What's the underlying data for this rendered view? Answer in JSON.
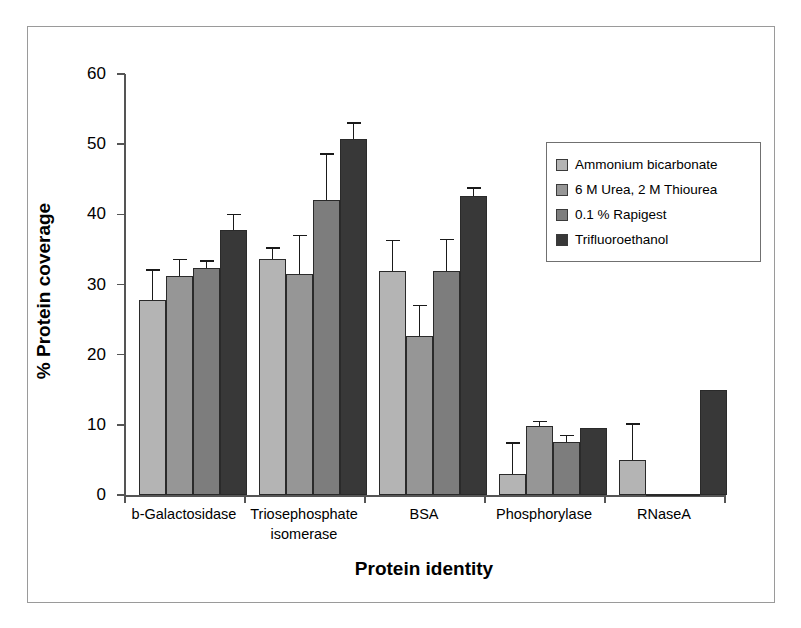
{
  "chart_data": {
    "type": "bar",
    "title": "",
    "xlabel": "Protein identity",
    "ylabel": "% Protein coverage",
    "ylim": [
      0,
      60
    ],
    "yticks": [
      0,
      10,
      20,
      30,
      40,
      50,
      60
    ],
    "ytick_labels": [
      "0",
      "10",
      "20",
      "30",
      "40",
      "50",
      "60"
    ],
    "grid": false,
    "legend_position": "upper right",
    "orientation": "vertical",
    "error_bars": "upper-only",
    "categories": [
      "b-Galactosidase",
      "Triosephosphate isomerase",
      "BSA",
      "Phosphorylase",
      "RNaseA"
    ],
    "category_lines": [
      [
        "b-Galactosidase"
      ],
      [
        "Triosephosphate",
        "isomerase"
      ],
      [
        "BSA"
      ],
      [
        "Phosphorylase"
      ],
      [
        "RNaseA"
      ]
    ],
    "series": [
      {
        "name": "Ammonium bicarbonate",
        "color": "#b4b4b4",
        "values": [
          27.8,
          33.7,
          31.9,
          3.0,
          5.0
        ],
        "errors": [
          4.4,
          1.6,
          4.5,
          4.5,
          5.2
        ]
      },
      {
        "name": "6 M Urea, 2 M Thiourea",
        "color": "#969696",
        "values": [
          31.2,
          31.5,
          22.7,
          9.8,
          0.2
        ],
        "errors": [
          2.5,
          5.6,
          4.4,
          0.8,
          0.0
        ]
      },
      {
        "name": "0.1 % Rapigest",
        "color": "#7d7d7d",
        "values": [
          32.3,
          42.0,
          31.9,
          7.6,
          0.2
        ],
        "errors": [
          1.2,
          6.7,
          4.6,
          1.0,
          0.0
        ]
      },
      {
        "name": "Trifluoroethanol",
        "color": "#383838",
        "values": [
          37.8,
          50.7,
          42.6,
          9.6,
          15.0
        ],
        "errors": [
          2.3,
          2.4,
          1.3,
          0.0,
          0.0
        ]
      }
    ]
  },
  "legend": {
    "items": [
      {
        "label": "Ammonium bicarbonate",
        "color": "#b4b4b4"
      },
      {
        "label": "6 M Urea, 2 M Thiourea",
        "color": "#969696"
      },
      {
        "label": "0.1 % Rapigest",
        "color": "#7d7d7d"
      },
      {
        "label": "Trifluoroethanol",
        "color": "#383838"
      }
    ]
  }
}
